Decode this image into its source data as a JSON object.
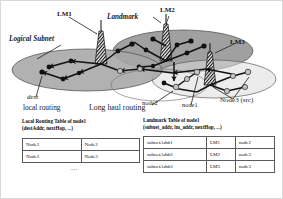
{
  "figure": {
    "title_labels": {
      "lm1": "LM1",
      "lm2": "LM2",
      "lm3": "LM3",
      "landmark": "Landmark",
      "logical_subnet": "Logical Subnet"
    },
    "node_labels": {
      "dest": "dest",
      "node1": "node1",
      "node2": "node2",
      "node3_src": "Node3 (src)"
    },
    "routing_labels": {
      "local_routing": "local routing",
      "long_haul_routing": "Long haul routing"
    },
    "colors": {
      "subnet_fill": "#9d9d9d",
      "subnet_fill_light": "#c9c9c9",
      "link": "#111111",
      "node_solid": "#111111",
      "node_open": "#b8b8b8",
      "frame": "#d8d8d8",
      "text": "#111111"
    }
  },
  "tables": {
    "local": {
      "caption_line1": "Local Routing Table of node1",
      "caption_line2": "(destAddr, nextHop, ...)",
      "columns": [
        "destAddr",
        "nextHop"
      ],
      "rows": [
        [
          "Node2",
          "Node2"
        ],
        [
          "Node3",
          "Node3"
        ]
      ],
      "ellipsis": "..."
    },
    "landmark": {
      "caption_line1": "Landmark Table of node1",
      "caption_line2": "(subnet_addr, lm_addr, nextHop, ...)",
      "columns": [
        "subnet_addr",
        "lm_addr",
        "nextHop"
      ],
      "rows": [
        [
          "subnetAddr1",
          "LM1",
          "node2"
        ],
        [
          "subnetAddr2",
          "LM2",
          "node3"
        ],
        [
          "subnetAddr3",
          "LM3",
          "node3"
        ]
      ]
    }
  }
}
